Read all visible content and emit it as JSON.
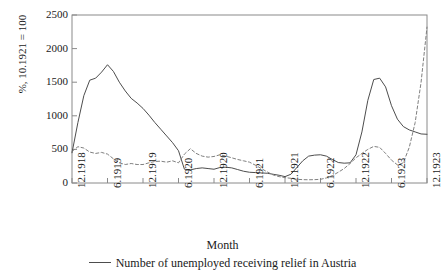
{
  "chart_data": {
    "type": "line",
    "title": "",
    "xlabel": "Month",
    "ylabel": "%, 10.1921 = 100",
    "ylim": [
      0,
      2500
    ],
    "yticks": [
      0,
      500,
      1000,
      1500,
      2000,
      2500
    ],
    "ytick_labels": [
      "0",
      "500",
      "1000",
      "1500",
      "2000",
      "2500"
    ],
    "grid": false,
    "legend_position": "bottom",
    "xtick_labels": [
      "12.1918",
      "6.1919",
      "12.1919",
      "6.1920",
      "12.1920",
      "6.1921",
      "12.1921",
      "6.1922",
      "12.1922",
      "6.1923",
      "12.1923"
    ],
    "x": [
      "12.1918",
      "1.1919",
      "2.1919",
      "3.1919",
      "4.1919",
      "5.1919",
      "6.1919",
      "7.1919",
      "8.1919",
      "9.1919",
      "10.1919",
      "11.1919",
      "12.1919",
      "1.1920",
      "2.1920",
      "3.1920",
      "4.1920",
      "5.1920",
      "6.1920",
      "7.1920",
      "8.1920",
      "9.1920",
      "10.1920",
      "11.1920",
      "12.1920",
      "1.1921",
      "2.1921",
      "3.1921",
      "4.1921",
      "5.1921",
      "6.1921",
      "7.1921",
      "8.1921",
      "9.1921",
      "10.1921",
      "11.1921",
      "12.1921",
      "1.1922",
      "2.1922",
      "3.1922",
      "4.1922",
      "5.1922",
      "6.1922",
      "7.1922",
      "8.1922",
      "9.1922",
      "10.1922",
      "11.1922",
      "12.1922",
      "1.1923",
      "2.1923",
      "3.1923",
      "4.1923",
      "5.1923",
      "6.1923",
      "7.1923",
      "8.1923",
      "9.1923",
      "10.1923",
      "11.1923",
      "12.1923"
    ],
    "series": [
      {
        "name": "Number of unemployed receiving relief in Austria",
        "style": "solid",
        "color": "#4d4d4d",
        "values": [
          450,
          900,
          1300,
          1530,
          1560,
          1650,
          1760,
          1660,
          1500,
          1370,
          1260,
          1190,
          1110,
          1010,
          900,
          800,
          700,
          600,
          480,
          205,
          195,
          215,
          225,
          215,
          205,
          230,
          235,
          225,
          200,
          175,
          160,
          155,
          150,
          145,
          130,
          115,
          95,
          130,
          230,
          330,
          400,
          415,
          420,
          400,
          350,
          305,
          295,
          300,
          420,
          760,
          1230,
          1540,
          1560,
          1430,
          1150,
          950,
          840,
          790,
          760,
          730,
          725
        ]
      },
      {
        "name": "Dashed comparison series",
        "style": "dashed",
        "color": "#808080",
        "values": [
          470,
          540,
          520,
          460,
          440,
          455,
          430,
          360,
          300,
          275,
          290,
          275,
          275,
          300,
          320,
          325,
          310,
          330,
          300,
          430,
          510,
          440,
          400,
          385,
          395,
          420,
          400,
          375,
          350,
          330,
          310,
          265,
          215,
          165,
          120,
          95,
          80,
          70,
          55,
          50,
          48,
          50,
          55,
          75,
          110,
          160,
          215,
          290,
          375,
          440,
          500,
          545,
          530,
          440,
          340,
          270,
          300,
          530,
          900,
          1500,
          2320
        ]
      }
    ]
  }
}
